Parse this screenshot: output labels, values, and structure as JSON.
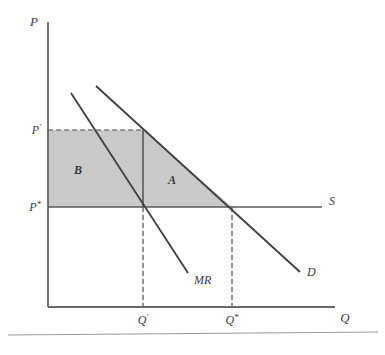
{
  "figure": {
    "type": "economics-supply-demand-diagram",
    "background_color": "#ffffff",
    "line_color": "#4a4a4a",
    "shade_color": "#c9c9c9"
  },
  "axes": {
    "y_axis": {
      "name": "price-axis",
      "label": "P",
      "x": 48,
      "y_top": 22,
      "y_bottom": 307
    },
    "x_axis": {
      "name": "quantity-axis",
      "label": "Q",
      "y": 307,
      "x_left": 48,
      "x_right": 335
    }
  },
  "price_ticks": [
    {
      "label": "P",
      "prime": "′",
      "y": 130,
      "name": "price-p-prime"
    },
    {
      "label": "P",
      "prime": "*",
      "y": 207,
      "name": "price-p-star"
    }
  ],
  "quantity_ticks": [
    {
      "label": "Q",
      "prime": "′",
      "x": 143,
      "name": "quantity-q-prime"
    },
    {
      "label": "Q",
      "prime": "*",
      "x": 232,
      "name": "quantity-q-star"
    }
  ],
  "curves": [
    {
      "id": "demand",
      "label": "D",
      "x1": 96,
      "y1": 86,
      "x2": 300,
      "y2": 272,
      "label_x": 307,
      "label_y": 276
    },
    {
      "id": "marginal-revenue",
      "label": "MR",
      "x1": 71,
      "y1": 93,
      "x2": 188,
      "y2": 273,
      "label_x": 194,
      "label_y": 284
    },
    {
      "id": "supply",
      "label": "S",
      "x1": 48,
      "y1": 207,
      "x2": 322,
      "y2": 207,
      "label_x": 329,
      "label_y": 205
    }
  ],
  "regions": [
    {
      "id": "region-b",
      "label": "B",
      "shape": "rectangle",
      "label_x": 78,
      "label_y": 174,
      "points": "48,130 143,130 143,207 48,207"
    },
    {
      "id": "region-a",
      "label": "A",
      "shape": "triangle",
      "label_x": 172,
      "label_y": 184,
      "points": "143,130 232,207 143,207"
    }
  ],
  "guide_lines": {
    "price_dashed": {
      "name": "p-prime-dashed-guide",
      "x1": 48,
      "y1": 130,
      "x2": 143,
      "y2": 130
    },
    "q_prime_dashed": {
      "name": "q-prime-dashed-guide",
      "x1": 143,
      "y1": 207,
      "x2": 143,
      "y2": 307
    },
    "q_star_dashed": {
      "name": "q-star-dashed-guide",
      "x1": 232,
      "y1": 207,
      "x2": 232,
      "y2": 307
    },
    "q_prime_vertical_solid": {
      "name": "q-prime-solid-segment",
      "x1": 143,
      "y1": 130,
      "x2": 143,
      "y2": 207
    }
  },
  "footer_rule": {
    "name": "page-bottom-rule",
    "y": 335
  },
  "chart_data": {
    "type": "line",
    "title": "",
    "xlabel": "Q",
    "ylabel": "P",
    "grid": false,
    "legend": "inline-curve-labels",
    "annotations": [
      "A",
      "B"
    ],
    "series": [
      {
        "name": "D",
        "x": [
          96,
          300
        ],
        "y": [
          86,
          272
        ],
        "note": "demand curve, downward sloping"
      },
      {
        "name": "MR",
        "x": [
          71,
          188
        ],
        "y": [
          93,
          273
        ],
        "note": "marginal revenue, twice the slope of D"
      },
      {
        "name": "S",
        "x": [
          48,
          322
        ],
        "y": [
          207,
          207
        ],
        "note": "supply curve, horizontal at P*"
      }
    ],
    "markers": {
      "P_prime": 130,
      "P_star": 207,
      "Q_prime": 143,
      "Q_star": 232
    },
    "shaded_regions": [
      {
        "label": "B",
        "description": "monopoly profit rectangle between P* and P' up to Q'"
      },
      {
        "label": "A",
        "description": "deadweight loss triangle between Q' and Q*"
      }
    ]
  }
}
